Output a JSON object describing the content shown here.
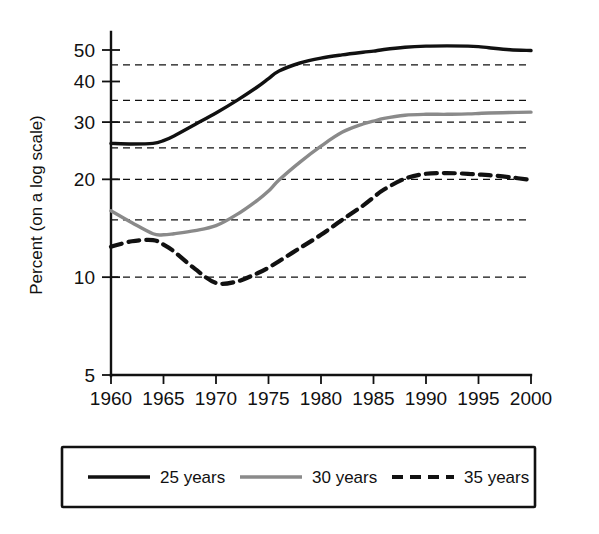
{
  "chart_data": {
    "type": "line",
    "title": "",
    "xlabel": "",
    "ylabel": "Percent (on a log scale)",
    "yscale": "log",
    "xlim": [
      1960,
      2000
    ],
    "ylim": [
      5,
      55
    ],
    "grid": true,
    "grid_axis": "y",
    "grid_style": "dashed",
    "legend_position": "below-plot",
    "x_ticks": [
      "1960",
      "1965",
      "1970",
      "1975",
      "1980",
      "1985",
      "1990",
      "1995",
      "2000"
    ],
    "x_tick_values": [
      1960,
      1965,
      1970,
      1975,
      1980,
      1985,
      1990,
      1995,
      2000
    ],
    "y_ticks": [
      "5",
      "10",
      "20",
      "30",
      "40",
      "50"
    ],
    "y_tick_values": [
      5,
      10,
      20,
      30,
      40,
      50
    ],
    "y_gridline_values": [
      10,
      15,
      20,
      25,
      30,
      35,
      45
    ],
    "x": [
      1960,
      1962,
      1964,
      1965,
      1966,
      1968,
      1970,
      1972,
      1974,
      1975,
      1976,
      1978,
      1980,
      1982,
      1984,
      1985,
      1986,
      1988,
      1990,
      1992,
      1994,
      1995,
      1996,
      1998,
      2000
    ],
    "series": [
      {
        "name": "25 years",
        "label": "25 years",
        "color": "#111111",
        "style": "solid",
        "width": 3.4,
        "values": [
          25.8,
          25.7,
          25.8,
          26.3,
          27.2,
          29.5,
          32.0,
          35.0,
          38.6,
          40.8,
          43.1,
          45.6,
          47.2,
          48.3,
          49.2,
          49.6,
          50.2,
          51.0,
          51.4,
          51.5,
          51.4,
          51.2,
          50.8,
          50.1,
          49.8
        ]
      },
      {
        "name": "30 years",
        "label": "30 years",
        "color": "#8a8a8a",
        "style": "solid",
        "width": 3.4,
        "values": [
          16.0,
          14.7,
          13.6,
          13.5,
          13.6,
          13.9,
          14.4,
          15.6,
          17.3,
          18.4,
          19.9,
          22.6,
          25.3,
          27.9,
          29.6,
          30.2,
          30.8,
          31.5,
          31.7,
          31.7,
          31.8,
          31.9,
          32.0,
          32.1,
          32.2
        ]
      },
      {
        "name": "35 years",
        "label": "35 years",
        "color": "#111111",
        "style": "dashed",
        "width": 4.2,
        "values": [
          12.4,
          12.9,
          13.0,
          12.6,
          12.0,
          10.6,
          9.6,
          9.7,
          10.3,
          10.7,
          11.2,
          12.3,
          13.5,
          15.0,
          16.6,
          17.6,
          18.6,
          20.1,
          20.8,
          20.9,
          20.8,
          20.7,
          20.6,
          20.3,
          19.9
        ]
      }
    ]
  },
  "legend": {
    "items": [
      {
        "label": "25 years",
        "style": "solid",
        "color": "#111111"
      },
      {
        "label": "30 years",
        "style": "solid",
        "color": "#8a8a8a"
      },
      {
        "label": "35 years",
        "style": "dashed",
        "color": "#111111"
      }
    ]
  },
  "axis": {
    "y_title": "Percent (on a log scale)"
  },
  "colors": {
    "series_25": "#111111",
    "series_30": "#8a8a8a",
    "series_35": "#111111",
    "axis": "#111111",
    "background": "#ffffff"
  }
}
